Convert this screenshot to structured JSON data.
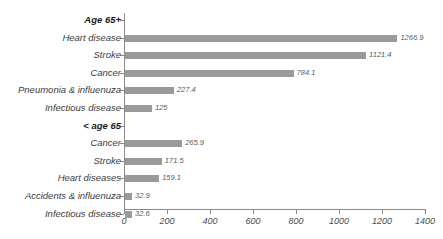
{
  "chart_data": {
    "type": "bar",
    "orientation": "horizontal",
    "title": "",
    "xlabel": "",
    "ylabel": "",
    "xlim": [
      0,
      1400
    ],
    "xticks": [
      0,
      200,
      400,
      600,
      800,
      1000,
      1200,
      1400
    ],
    "xtick_labels": [
      "0",
      "200",
      "400",
      "600",
      "800",
      "1000",
      "1200",
      "1400"
    ],
    "grid": false,
    "legend": false,
    "bar_color": "#9a9a9a",
    "axis_color": "#8a8a8a",
    "groups": [
      {
        "name": "Age 65+",
        "categories": [
          "Heart disease",
          "Stroke",
          "Cancer",
          "Pneumonia & influenuza",
          "Infectious disease"
        ],
        "values": [
          1266.9,
          1121.4,
          784.1,
          227.4,
          125
        ],
        "value_labels": [
          "1266.9",
          "1121.4",
          "784.1",
          "227.4",
          "125"
        ]
      },
      {
        "name": "< age 65",
        "categories": [
          "Cancer",
          "Stroke",
          "Heart diseases",
          "Accidents & influenuza",
          "Infectious disease"
        ],
        "values": [
          265.9,
          171.5,
          159.1,
          32.9,
          32.6
        ],
        "value_labels": [
          "265.9",
          "171.5",
          "159.1",
          "32.9",
          "32.6"
        ]
      }
    ]
  }
}
